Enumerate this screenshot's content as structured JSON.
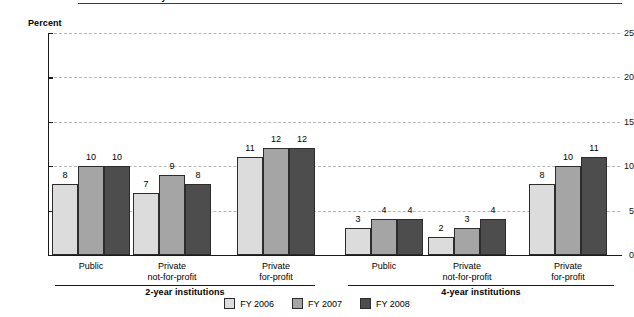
{
  "title": "institution: Fiscal years 2006–2008",
  "legend": {
    "items": [
      {
        "label": "FY 2006",
        "color": "#dcdcdc"
      },
      {
        "label": "FY 2007",
        "color": "#a5a5a5"
      },
      {
        "label": "FY 2008",
        "color": "#4d4d4d"
      }
    ]
  },
  "groups": [
    {
      "label": "2-year institutions"
    },
    {
      "label": "4-year institutions"
    }
  ],
  "chart_data": {
    "type": "bar",
    "title": "institution: Fiscal years 2006–2008",
    "xlabel": "",
    "ylabel": "Percent",
    "ylim": [
      0,
      25
    ],
    "yticks": [
      "0",
      "5",
      "10",
      "15",
      "20",
      "25"
    ],
    "grid": true,
    "legend_position": "bottom",
    "categories": [
      "Public",
      "Private not-for-profit",
      "Private for-profit",
      "Public",
      "Private not-for-profit",
      "Private for-profit"
    ],
    "category_lines": [
      [
        "Public",
        ""
      ],
      [
        "Private",
        "not-for-profit"
      ],
      [
        "Private",
        "for-profit"
      ],
      [
        "Public",
        ""
      ],
      [
        "Private",
        "not-for-profit"
      ],
      [
        "Private",
        "for-profit"
      ]
    ],
    "supercategories": [
      "2-year institutions",
      "4-year institutions"
    ],
    "series": [
      {
        "name": "FY 2006",
        "color": "#dcdcdc",
        "values": [
          8,
          7,
          11,
          3,
          2,
          8
        ]
      },
      {
        "name": "FY 2007",
        "color": "#a5a5a5",
        "values": [
          10,
          9,
          12,
          4,
          3,
          10
        ]
      },
      {
        "name": "FY 2008",
        "color": "#4d4d4d",
        "values": [
          10,
          8,
          12,
          4,
          4,
          11
        ]
      }
    ]
  }
}
